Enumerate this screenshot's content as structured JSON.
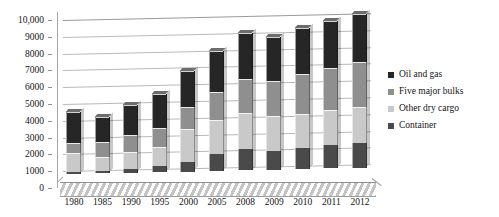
{
  "chart_data": {
    "type": "bar",
    "stacked": true,
    "title": "",
    "subtitle": "",
    "xlabel": "",
    "ylabel": "",
    "ylim": [
      0,
      10000
    ],
    "ytick_labels": [
      "0",
      "1000",
      "2000",
      "3000",
      "4000",
      "5000",
      "6000",
      "7000",
      "8000",
      "9000",
      "10,000"
    ],
    "ytick_values": [
      0,
      1000,
      2000,
      3000,
      4000,
      5000,
      6000,
      7000,
      8000,
      9000,
      10000
    ],
    "grid": true,
    "legend_position": "right",
    "categories": [
      "1980",
      "1985",
      "1990",
      "1995",
      "2000",
      "2005",
      "2008",
      "2009",
      "2010",
      "2011",
      "2012"
    ],
    "series": [
      {
        "name": "Container",
        "color": "#4a4a4a",
        "values": [
          102,
          152,
          234,
          371,
          598,
          1001,
          1249,
          1127,
          1280,
          1393,
          1498
        ]
      },
      {
        "name": "Other dry cargo",
        "color": "#c9c9c9",
        "values": [
          1123,
          819,
          1031,
          1125,
          1928,
          2009,
          2141,
          2065,
          2027,
          2112,
          2141
        ]
      },
      {
        "name": "Five major bulks",
        "color": "#8f8f8f",
        "values": [
          608,
          900,
          988,
          1105,
          1295,
          1709,
          2065,
          2085,
          2335,
          2477,
          2665
        ]
      },
      {
        "name": "Oil and gas",
        "color": "#262626",
        "values": [
          1871,
          1459,
          1755,
          2050,
          2163,
          2422,
          2742,
          2642,
          2752,
          2785,
          2840
        ]
      }
    ]
  },
  "legend": {
    "items": [
      {
        "label": "Oil and gas",
        "color": "#262626"
      },
      {
        "label": "Five major bulks",
        "color": "#8f8f8f"
      },
      {
        "label": "Other dry cargo",
        "color": "#c9c9c9"
      },
      {
        "label": "Container",
        "color": "#4a4a4a"
      }
    ]
  }
}
